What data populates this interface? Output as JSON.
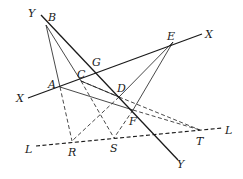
{
  "diagram": {
    "type": "projective-geometry-figure",
    "lines": {
      "X": {
        "label_start": "X",
        "label_end": "X"
      },
      "Y": {
        "label_start": "Y",
        "label_end": "Y"
      },
      "L": {
        "label_start": "L",
        "label_end": "L"
      }
    },
    "points": {
      "A": "A",
      "B": "B",
      "C": "C",
      "D": "D",
      "E": "E",
      "F": "F",
      "G": "G",
      "R": "R",
      "S": "S",
      "T": "T"
    },
    "colors": {
      "ink": "#1a1a1a",
      "background": "#ffffff"
    }
  }
}
